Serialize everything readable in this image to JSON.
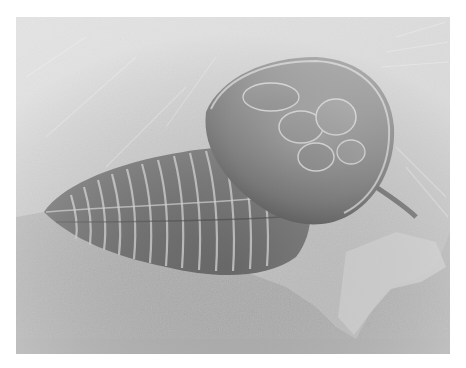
{
  "image": {
    "subject": "trilobite-fossil",
    "colors": {
      "page_background": "#ffffff",
      "rock_light": "#d8d8d8",
      "rock_mid": "#bdbdbd",
      "backdrop_light": "#d4d4d4",
      "backdrop_dark": "#9a9a9a",
      "fossil_dark": "#4a4a4a",
      "fossil_mid": "#6e6e6e",
      "fossil_highlight": "#cfcfcf"
    }
  }
}
